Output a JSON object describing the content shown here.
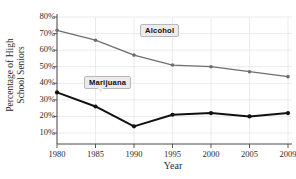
{
  "chart_data": {
    "type": "line",
    "title": "",
    "xlabel": "Year",
    "ylabel": "Percentage of High School Seniors",
    "ylabel_line1": "Percentage of High",
    "ylabel_line2": "School Seniors",
    "x": [
      1980,
      1985,
      1990,
      1995,
      2000,
      2005,
      2009
    ],
    "xtick_labels": [
      "1980",
      "1985",
      "1990",
      "1995",
      "2000",
      "2005",
      "2009"
    ],
    "ytick_labels": [
      "80%",
      "70%",
      "60%",
      "50%",
      "40%",
      "30%",
      "20%",
      "10%"
    ],
    "ytick_values": [
      80,
      70,
      60,
      50,
      40,
      30,
      20,
      10
    ],
    "ylim": [
      0,
      80
    ],
    "xlim": [
      1980,
      2009
    ],
    "grid": true,
    "grid_color": "#e3e3e3",
    "legend_position": "inline-callout",
    "series": [
      {
        "name": "Alcohol",
        "color": "#6e6e6e",
        "marker": "circle",
        "line_width": 1.3,
        "values": [
          72,
          66,
          57,
          51,
          50,
          47,
          44
        ]
      },
      {
        "name": "Marijuana",
        "color": "#111111",
        "marker": "circle",
        "line_width": 2.0,
        "values": [
          34.5,
          26,
          14,
          21,
          22,
          20,
          22
        ]
      }
    ],
    "annotations": [
      {
        "text": "Alcohol",
        "x": 1993,
        "y": 66
      },
      {
        "text": "Marijuana",
        "x": 1986,
        "y": 42
      }
    ]
  },
  "axes": {
    "x_title": "Year",
    "y_title_line1": "Percentage of High",
    "y_title_line2": "School Seniors"
  },
  "labels": {
    "alcohol": "Alcohol",
    "marijuana": "Marijuana"
  }
}
